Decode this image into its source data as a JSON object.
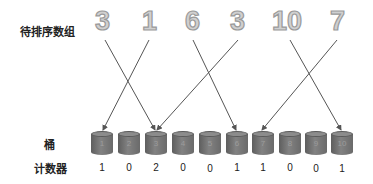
{
  "title_label": "待排序数组",
  "bucket_label": "桶",
  "counter_label": "计数器",
  "array": [
    {
      "value": "3",
      "x": 95
    },
    {
      "value": "1",
      "x": 142
    },
    {
      "value": "6",
      "x": 185
    },
    {
      "value": "3",
      "x": 230
    },
    {
      "value": "10",
      "x": 272
    },
    {
      "value": "7",
      "x": 330
    }
  ],
  "buckets": [
    {
      "index": "1",
      "count": "1"
    },
    {
      "index": "2",
      "count": "0"
    },
    {
      "index": "3",
      "count": "2"
    },
    {
      "index": "4",
      "count": "0"
    },
    {
      "index": "5",
      "count": "0"
    },
    {
      "index": "6",
      "count": "1"
    },
    {
      "index": "7",
      "count": "1"
    },
    {
      "index": "8",
      "count": "0"
    },
    {
      "index": "9",
      "count": "0"
    },
    {
      "index": "10",
      "count": "1"
    }
  ],
  "colors": {
    "arrow": "#555555",
    "bucket": "#6e6e6e",
    "digit_fill": "#d0d0d0"
  }
}
